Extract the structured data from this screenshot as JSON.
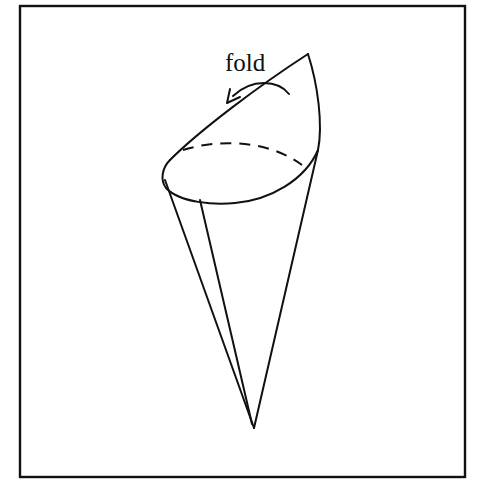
{
  "figure": {
    "label": "fold",
    "colors": {
      "stroke": "#111111",
      "background": "#ffffff"
    }
  }
}
